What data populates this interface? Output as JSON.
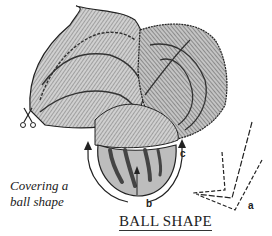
{
  "figure": {
    "title": "BALL SHAPE",
    "caption_line1": "Covering a",
    "caption_line2": "ball shape",
    "labels": {
      "a": "a",
      "b": "b",
      "c": "c"
    },
    "colors": {
      "fabric_fill": "#c8c8c8",
      "ink": "#222222",
      "background": "#ffffff"
    }
  }
}
